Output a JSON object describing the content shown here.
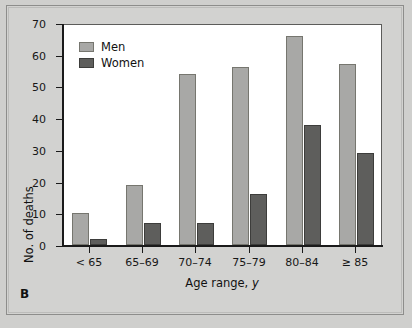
{
  "panel": {
    "letter": "B"
  },
  "chart_data": {
    "type": "bar",
    "title": "",
    "xlabel": "Age range, y",
    "xlabel_plain": "Age range,",
    "xlabel_italic": "y",
    "ylabel": "No. of deaths",
    "categories": [
      "< 65",
      "65–69",
      "70–74",
      "75–79",
      "80–84",
      "≥ 85"
    ],
    "series": [
      {
        "name": "Men",
        "color": "#a8a8a6",
        "values": [
          10,
          19,
          54,
          56,
          66,
          57
        ]
      },
      {
        "name": "Women",
        "color": "#5e5e5c",
        "values": [
          2,
          7,
          7,
          16,
          38,
          29
        ]
      }
    ],
    "ylim": [
      0,
      70
    ],
    "yticks": [
      0,
      10,
      20,
      30,
      40,
      50,
      60,
      70
    ],
    "ytick_labels": [
      "0",
      "10",
      "20",
      "30",
      "40",
      "50",
      "60",
      "70"
    ],
    "grid": false,
    "legend_position": "top-left"
  }
}
